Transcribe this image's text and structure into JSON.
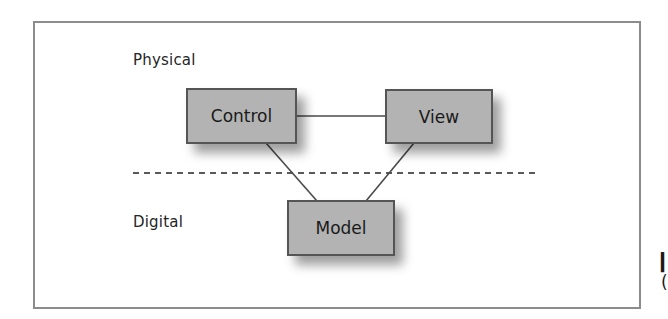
{
  "diagram": {
    "title": "",
    "zones": [
      {
        "label": "Physical"
      },
      {
        "label": "Digital"
      }
    ],
    "nodes": [
      {
        "id": "control",
        "label": "Control",
        "zone": "Physical"
      },
      {
        "id": "view",
        "label": "View",
        "zone": "Physical"
      },
      {
        "id": "model",
        "label": "Model",
        "zone": "Digital"
      }
    ],
    "edges": [
      {
        "from": "control",
        "to": "view"
      },
      {
        "from": "control",
        "to": "model"
      },
      {
        "from": "view",
        "to": "model"
      }
    ],
    "divider": {
      "style": "dashed",
      "separates": [
        "Physical",
        "Digital"
      ]
    },
    "colors": {
      "node_fill": "#b3b3b3",
      "node_border": "#555555",
      "edge": "#4a4a4a",
      "frame": "#8c8c8c",
      "divider": "#5a5a5a"
    }
  }
}
